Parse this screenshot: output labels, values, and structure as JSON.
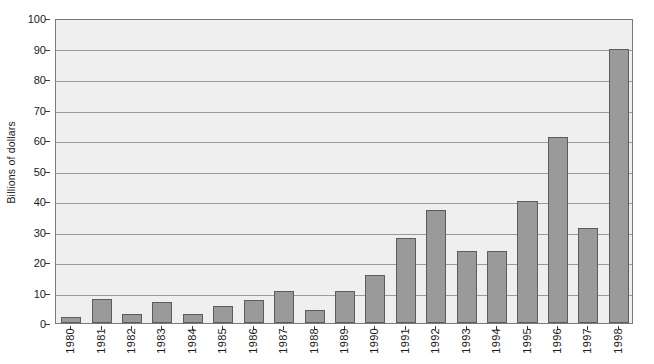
{
  "chart_data": {
    "type": "bar",
    "title": "",
    "subtitle": "",
    "xlabel": "",
    "ylabel": "Billions of dollars",
    "ylim": [
      0,
      100
    ],
    "ytick_labels": [
      "0",
      "10",
      "20",
      "30",
      "40",
      "50",
      "60",
      "70",
      "80",
      "90",
      "100"
    ],
    "ytick_values": [
      0,
      10,
      20,
      30,
      40,
      50,
      60,
      70,
      80,
      90,
      100
    ],
    "grid": true,
    "legend": null,
    "categories": [
      "1980",
      "1981",
      "1982",
      "1983",
      "1984",
      "1985",
      "1986",
      "1987",
      "1988",
      "1989",
      "1990",
      "1991",
      "1992",
      "1993",
      "1994",
      "1995",
      "1996",
      "1997",
      "1998"
    ],
    "values": [
      2,
      8,
      3,
      6.8,
      3,
      5.6,
      7.5,
      10.4,
      4.2,
      10.6,
      15.6,
      28,
      37,
      23.6,
      23.6,
      40,
      61,
      31,
      90
    ],
    "series": [
      {
        "name": "",
        "values": [
          2,
          8,
          3,
          6.8,
          3,
          5.6,
          7.5,
          10.4,
          4.2,
          10.6,
          15.6,
          28,
          37,
          23.6,
          23.6,
          40,
          61,
          31,
          90
        ]
      }
    ],
    "colors": {
      "bar_fill": "#9a9a9a",
      "bar_stroke": "#5c5c5c",
      "plot_background": "#efefef",
      "gridline": "#9a9a9a",
      "axis": "#3a3a3a",
      "text": "#1a1a1a"
    }
  }
}
